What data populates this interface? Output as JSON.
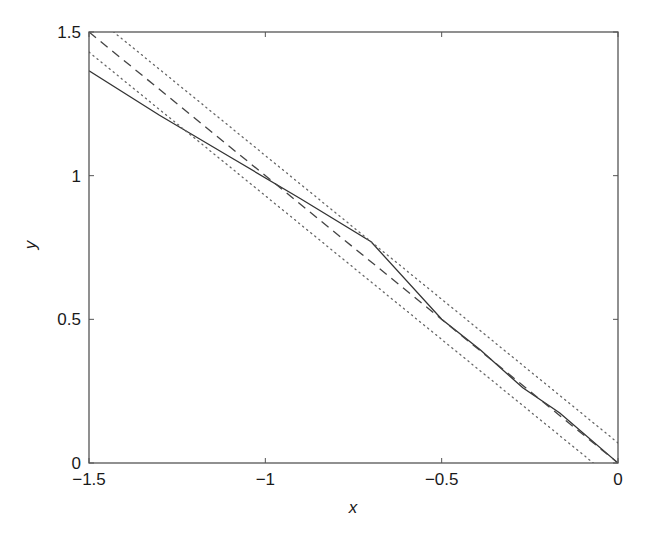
{
  "chart_data": {
    "type": "line",
    "title": "",
    "xlabel": "x",
    "ylabel": "y",
    "xlim": [
      -1.5,
      0
    ],
    "ylim": [
      0,
      1.5
    ],
    "grid": false,
    "legend": null,
    "x_ticks": [
      -1.5,
      -1,
      -0.5,
      0
    ],
    "x_tick_labels": [
      "−1.5",
      "−1",
      "−0.5",
      "0"
    ],
    "y_ticks": [
      0,
      0.5,
      1,
      1.5
    ],
    "y_tick_labels": [
      "0",
      "0.5",
      "1",
      "1.5"
    ],
    "series": [
      {
        "name": "solid",
        "style": "solid",
        "color": "#333333",
        "x": [
          -1.5,
          -1.3,
          -1.1,
          -0.9,
          -0.7,
          -0.5,
          -0.39,
          -0.27,
          -0.165,
          0
        ],
        "y": [
          1.365,
          1.21,
          1.065,
          0.92,
          0.77,
          0.5,
          0.393,
          0.262,
          0.174,
          0
        ]
      },
      {
        "name": "dashed",
        "style": "dashed",
        "color": "#444444",
        "x": [
          -1.5,
          0
        ],
        "y": [
          1.5,
          0
        ]
      },
      {
        "name": "dotted-upper",
        "style": "dotted",
        "color": "#666666",
        "x": [
          -1.5,
          0
        ],
        "y": [
          1.57,
          0.07
        ]
      },
      {
        "name": "dotted-lower",
        "style": "dotted",
        "color": "#666666",
        "x": [
          -1.5,
          0
        ],
        "y": [
          1.43,
          -0.07
        ]
      }
    ]
  }
}
